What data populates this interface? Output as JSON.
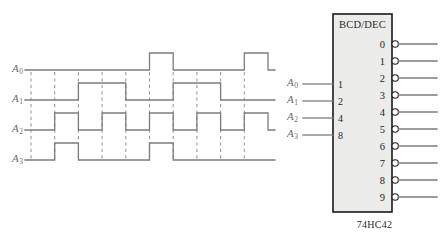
{
  "diagram": {
    "title_visible": false,
    "kind": "bcd-to-decimal-decoder-timing-diagram"
  },
  "timing": {
    "signal_labels": [
      {
        "base": "A",
        "sub": "0"
      },
      {
        "base": "A",
        "sub": "1"
      },
      {
        "base": "A",
        "sub": "2"
      },
      {
        "base": "A",
        "sub": "3"
      }
    ],
    "period_count": 10,
    "x_start": 31,
    "x_end": 268,
    "period_width": 23.7,
    "rows": [
      {
        "name": "A0",
        "baseline_y": 70,
        "high_y": 53,
        "bits": [
          0,
          0,
          0,
          0,
          0,
          1,
          0,
          0,
          0,
          1
        ]
      },
      {
        "name": "A1",
        "baseline_y": 100,
        "high_y": 83,
        "bits": [
          0,
          0,
          1,
          1,
          0,
          0,
          1,
          1,
          0,
          0
        ]
      },
      {
        "name": "A2",
        "baseline_y": 130,
        "high_y": 113,
        "bits": [
          0,
          1,
          0,
          1,
          0,
          1,
          0,
          1,
          0,
          1
        ]
      },
      {
        "name": "A3",
        "baseline_y": 160,
        "high_y": 143,
        "bits": [
          0,
          1,
          0,
          0,
          0,
          1,
          0,
          0,
          0,
          0
        ]
      }
    ],
    "dash_top": 72,
    "dash_bottom": 160
  },
  "ic": {
    "function_label": "BCD/DEC",
    "part_number": "74HC42",
    "box": {
      "x": 333,
      "y": 14,
      "w": 59,
      "h": 198
    },
    "inputs": [
      {
        "signal_base": "A",
        "signal_sub": "0",
        "weight": "1",
        "y": 84
      },
      {
        "signal_base": "A",
        "signal_sub": "1",
        "weight": "2",
        "y": 101
      },
      {
        "signal_base": "A",
        "signal_sub": "2",
        "weight": "4",
        "y": 118
      },
      {
        "signal_base": "A",
        "signal_sub": "3",
        "weight": "8",
        "y": 135
      }
    ],
    "outputs": [
      {
        "label": "0",
        "y": 44
      },
      {
        "label": "1",
        "y": 61
      },
      {
        "label": "2",
        "y": 78
      },
      {
        "label": "3",
        "y": 95
      },
      {
        "label": "4",
        "y": 112
      },
      {
        "label": "5",
        "y": 129
      },
      {
        "label": "6",
        "y": 146
      },
      {
        "label": "7",
        "y": 163
      },
      {
        "label": "8",
        "y": 180
      },
      {
        "label": "9",
        "y": 197
      }
    ]
  },
  "colors": {
    "wire": "#7c7c7c",
    "dash": "#9a9a9a",
    "ic_fill": "#ececeb",
    "ic_stroke": "#1a1a1a",
    "label_text": "#6a6a6a",
    "pin_text": "#1f1f1f",
    "background": "#ffffff"
  }
}
